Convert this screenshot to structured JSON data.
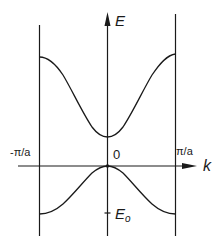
{
  "diagram": {
    "type": "band-structure",
    "axes": {
      "y_label": "E",
      "x_label": "k",
      "origin_label": "0",
      "left_boundary_label": "-π/a",
      "right_boundary_label": "π/a",
      "tick_label": "E",
      "tick_label_subscript": "o"
    },
    "colors": {
      "line": "#1a1a1a",
      "background": "#ffffff"
    },
    "curves": [
      {
        "name": "upper-band",
        "shape": "minimum at k=0, rises toward zone boundaries"
      },
      {
        "name": "lower-band",
        "shape": "maximum at k=0 (touching axis), falls toward zone boundaries to level E_o"
      }
    ]
  }
}
